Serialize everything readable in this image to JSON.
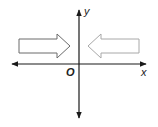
{
  "diagram": {
    "type": "coordinate-plane",
    "labels": {
      "x_axis": "x",
      "y_axis": "y",
      "origin": "O"
    },
    "arrows": [
      {
        "name": "left-arrow",
        "direction": "right",
        "stroke": "#6b6b6b"
      },
      {
        "name": "right-arrow",
        "direction": "left",
        "stroke": "#a8a8a8"
      }
    ],
    "colors": {
      "axis": "#1a1a1a",
      "background": "#ffffff"
    }
  }
}
